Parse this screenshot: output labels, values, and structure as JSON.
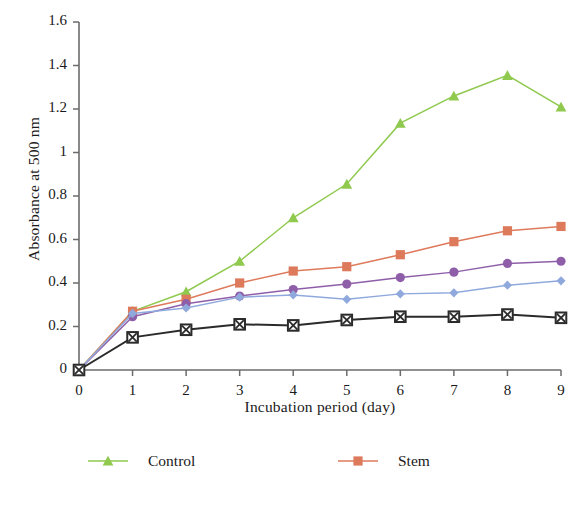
{
  "chart_data": {
    "type": "line",
    "title": "",
    "xlabel": "Incubation period (day)",
    "ylabel": "Absorbance at 500 nm",
    "x": [
      0,
      1,
      2,
      3,
      4,
      5,
      6,
      7,
      8,
      9
    ],
    "xtick_labels": [
      "0",
      "1",
      "2",
      "3",
      "4",
      "5",
      "6",
      "7",
      "8",
      "9"
    ],
    "ytick_labels": [
      "0",
      "0.2",
      "0.4",
      "0.6",
      "0.8",
      "1",
      "1.2",
      "1.4",
      "1.6"
    ],
    "ytick_values": [
      0,
      0.2,
      0.4,
      0.6,
      0.8,
      1,
      1.2,
      1.4,
      1.6
    ],
    "xlim": [
      0,
      9
    ],
    "ylim": [
      0,
      1.6
    ],
    "grid": false,
    "legend_position": "bottom",
    "series": [
      {
        "name": "Control",
        "color": "#8fc94e",
        "marker": "triangle",
        "values": [
          0,
          0.27,
          0.36,
          0.5,
          0.7,
          0.855,
          1.135,
          1.26,
          1.355,
          1.21
        ]
      },
      {
        "name": "Stem",
        "color": "#de7a5c",
        "marker": "square",
        "values": [
          0,
          0.27,
          0.325,
          0.4,
          0.455,
          0.475,
          0.53,
          0.59,
          0.64,
          0.66
        ]
      },
      {
        "name": "Seed",
        "color": "#8e5fa8",
        "marker": "circle",
        "values": [
          0,
          0.245,
          0.305,
          0.34,
          0.37,
          0.395,
          0.425,
          0.45,
          0.49,
          0.5
        ]
      },
      {
        "name": "Leaf",
        "color": "#90a9dd",
        "marker": "diamond",
        "values": [
          0,
          0.26,
          0.285,
          0.335,
          0.345,
          0.325,
          0.35,
          0.355,
          0.39,
          0.41
        ]
      },
      {
        "name": "Ascorbic acid",
        "color": "#2b2b2b",
        "marker": "xbox",
        "values": [
          0,
          0.15,
          0.185,
          0.21,
          0.205,
          0.23,
          0.245,
          0.245,
          0.255,
          0.24
        ]
      }
    ]
  },
  "axis": {
    "x_title": "Incubation period (day)",
    "y_title": "Absorbance at 500 nm"
  },
  "legend": {
    "items": [
      {
        "label": "Control"
      },
      {
        "label": "Stem"
      },
      {
        "label": "Seed"
      },
      {
        "label": "Leaf"
      },
      {
        "label": "Ascorbic acid"
      }
    ]
  }
}
